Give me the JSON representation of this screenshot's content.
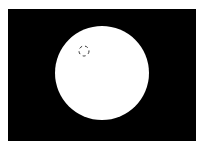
{
  "scene": {
    "background": "#ffffff",
    "frame": {
      "x": 8,
      "y": 9,
      "width": 188,
      "height": 132,
      "color": "#000000"
    },
    "disk": {
      "cx": 102,
      "cy": 73,
      "r": 47,
      "color": "#ffffff"
    },
    "marker": {
      "cx": 84,
      "cy": 51,
      "r": 5,
      "stroke": "#333333",
      "style": "dashed"
    }
  }
}
